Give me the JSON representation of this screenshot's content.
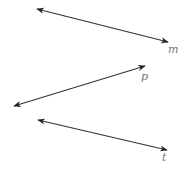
{
  "diagram": {
    "stroke_color": "#333333",
    "label_color": "#777777",
    "lines": [
      {
        "id": "m",
        "label": "m",
        "x1": 37,
        "y1": 9,
        "x2": 168,
        "y2": 42,
        "label_x": 168,
        "label_y": 53
      },
      {
        "id": "p",
        "label": "p",
        "x1": 14,
        "y1": 106,
        "x2": 145,
        "y2": 66,
        "label_x": 141,
        "label_y": 80
      },
      {
        "id": "t",
        "label": "t",
        "x1": 38,
        "y1": 120,
        "x2": 167,
        "y2": 150,
        "label_x": 162,
        "label_y": 161
      }
    ]
  }
}
